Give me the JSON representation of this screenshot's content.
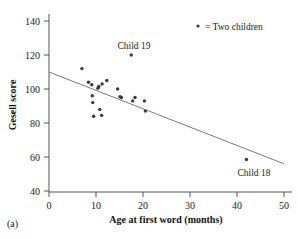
{
  "panel": {
    "label": "(a)"
  },
  "legend": {
    "marker": "dot-marker",
    "text": "= Two children"
  },
  "annotations": [
    {
      "name": "child-19",
      "text": "Child 19",
      "x": 17.5,
      "y": 120
    },
    {
      "name": "child-18",
      "text": "Child 18",
      "x": 42,
      "y": 59
    }
  ],
  "chart_data": {
    "type": "scatter",
    "title": "",
    "xlabel": "Age at first word (months)",
    "ylabel": "Gesell score",
    "xlim": [
      0,
      50
    ],
    "ylim": [
      40,
      140
    ],
    "xticks": [
      0,
      10,
      20,
      30,
      40,
      50
    ],
    "yticks": [
      40,
      60,
      80,
      100,
      120,
      140
    ],
    "xtick_labels": [
      "0",
      "10",
      "20",
      "30",
      "40",
      "50"
    ],
    "ytick_labels": [
      "40",
      "60",
      "80",
      "100",
      "120",
      "140"
    ],
    "grid": false,
    "legend_position": "top-right",
    "points": [
      {
        "x": 15,
        "y": 95
      },
      {
        "x": 26,
        "y": 71
      },
      {
        "x": 10,
        "y": 83
      },
      {
        "x": 9,
        "y": 91
      },
      {
        "x": 15,
        "y": 102
      },
      {
        "x": 20,
        "y": 87
      },
      {
        "x": 18,
        "y": 93
      },
      {
        "x": 11,
        "y": 100
      },
      {
        "x": 8,
        "y": 104
      },
      {
        "x": 20,
        "y": 94
      },
      {
        "x": 7,
        "y": 113
      },
      {
        "x": 9,
        "y": 96
      },
      {
        "x": 10,
        "y": 83
      },
      {
        "x": 11,
        "y": 84
      },
      {
        "x": 11,
        "y": 102
      },
      {
        "x": 10,
        "y": 100
      },
      {
        "x": 12,
        "y": 105
      },
      {
        "x": 42,
        "y": 57
      },
      {
        "x": 17,
        "y": 121
      },
      {
        "x": 11,
        "y": 86
      },
      {
        "x": 10,
        "y": 100
      },
      {
        "x": 12,
        "y": 104
      },
      {
        "x": 42,
        "y": 59
      },
      {
        "x": 17,
        "y": 90
      },
      {
        "x": 11,
        "y": 94
      },
      {
        "x": 10,
        "y": 96
      },
      {
        "x": 15,
        "y": 100
      },
      {
        "x": 18,
        "y": 95
      }
    ],
    "plotted_markers": [
      {
        "x": 7,
        "y": 112
      },
      {
        "x": 8.4,
        "y": 104
      },
      {
        "x": 9.1,
        "y": 102.5
      },
      {
        "x": 9.2,
        "y": 96
      },
      {
        "x": 9.3,
        "y": 92
      },
      {
        "x": 9.5,
        "y": 84
      },
      {
        "x": 10.4,
        "y": 100.5
      },
      {
        "x": 10.6,
        "y": 101.5
      },
      {
        "x": 10.8,
        "y": 88
      },
      {
        "x": 11.2,
        "y": 84.5
      },
      {
        "x": 11.3,
        "y": 103
      },
      {
        "x": 12.3,
        "y": 105
      },
      {
        "x": 14.6,
        "y": 100
      },
      {
        "x": 15.1,
        "y": 95.5
      },
      {
        "x": 15.4,
        "y": 95
      },
      {
        "x": 17.5,
        "y": 120
      },
      {
        "x": 17.8,
        "y": 93
      },
      {
        "x": 18.3,
        "y": 95
      },
      {
        "x": 20.3,
        "y": 93
      },
      {
        "x": 20.5,
        "y": 87
      },
      {
        "x": 42,
        "y": 58.5
      }
    ],
    "fit_line": {
      "x": [
        0,
        50
      ],
      "y": [
        110,
        56
      ]
    }
  }
}
